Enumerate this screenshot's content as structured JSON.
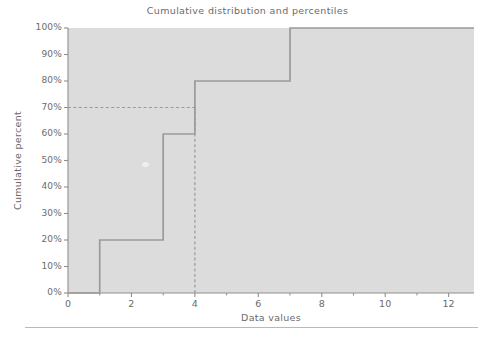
{
  "figure": {
    "title": "Cumulative distribution and percentiles",
    "background_color": "#ffffff",
    "plot_background_color": "#dcdcdc",
    "line_color": "#9a9a9a",
    "axis_color": "#8f8f8f",
    "text_color": "#6b6b6b",
    "bottom_rule": true
  },
  "chart_data": {
    "type": "line",
    "subtype": "step-cumulative-distribution",
    "title": "Cumulative distribution and percentiles",
    "xlabel": "Data values",
    "ylabel": "Cumulative percent",
    "xlim": [
      0,
      12.8
    ],
    "ylim": [
      0,
      100
    ],
    "grid": false,
    "legend": null,
    "x_ticks": [
      0,
      2,
      4,
      6,
      8,
      10,
      12
    ],
    "x_tick_labels": [
      "0",
      "2",
      "4",
      "6",
      "8",
      "10",
      "12"
    ],
    "x_minor_ticks": [
      1,
      3,
      5,
      7,
      9,
      11
    ],
    "y_ticks": [
      0,
      10,
      20,
      30,
      40,
      50,
      60,
      70,
      80,
      90,
      100
    ],
    "y_tick_labels": [
      "0%",
      "10%",
      "20%",
      "30%",
      "40%",
      "50%",
      "60%",
      "70%",
      "80%",
      "90%",
      "100%"
    ],
    "series": [
      {
        "name": "Cumulative percent",
        "type": "step",
        "step_mode": "post",
        "x": [
          0,
          1,
          1,
          3,
          3,
          4,
          4,
          7,
          7,
          12.8
        ],
        "y": [
          0,
          0,
          20,
          20,
          60,
          60,
          80,
          80,
          100,
          100
        ],
        "steps": [
          {
            "x_from": 0,
            "x_to": 1,
            "percent": 0
          },
          {
            "x_from": 1,
            "x_to": 3,
            "percent": 20
          },
          {
            "x_from": 3,
            "x_to": 4,
            "percent": 60
          },
          {
            "x_from": 4,
            "x_to": 7,
            "percent": 80
          },
          {
            "x_from": 7,
            "x_to": 12.8,
            "percent": 100
          }
        ]
      }
    ],
    "reference_lines": [
      {
        "name": "percentile-horizontal",
        "orientation": "horizontal",
        "value": 70,
        "style": "dashed",
        "x_from": 0,
        "x_to": 4
      },
      {
        "name": "percentile-vertical",
        "orientation": "vertical",
        "value": 4,
        "style": "dashed",
        "y_from": 0,
        "y_to": 70
      }
    ]
  }
}
